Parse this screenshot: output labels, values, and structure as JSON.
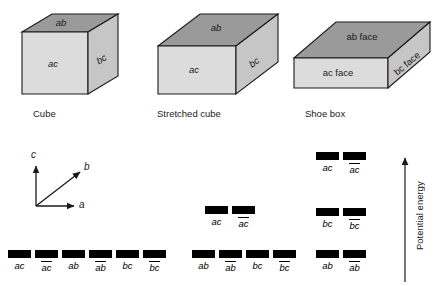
{
  "figure": {
    "energy_axis_label": "Potential energy",
    "colors": {
      "top_face": "#9a9a9a",
      "front_face": "#dcdcdc",
      "side_face": "#c6c6c6",
      "outline": "#1a1a1a",
      "level_bar": "#000000"
    }
  },
  "axis_triad": {
    "a": "a",
    "b": "b",
    "c": "c"
  },
  "boxes": [
    {
      "id": "cube",
      "caption": "Cube",
      "faces": {
        "top": "ab",
        "front": "ac",
        "side": "bc"
      }
    },
    {
      "id": "stretched-cube",
      "caption": "Stretched cube",
      "faces": {
        "top": "ab",
        "front": "ac",
        "side": "bc"
      }
    },
    {
      "id": "shoe-box",
      "caption": "Shoe box",
      "faces": {
        "top": "ab face",
        "front": "ac face",
        "side": "bc face"
      }
    }
  ],
  "level_diagrams": [
    {
      "id": "cube-levels",
      "for_box": "cube",
      "rows": [
        {
          "energy_rank": 1,
          "levels": [
            {
              "label": "ac",
              "overline": false
            },
            {
              "label": "ac",
              "overline": true
            },
            {
              "label": "ab",
              "overline": false
            },
            {
              "label": "ab",
              "overline": true
            },
            {
              "label": "bc",
              "overline": false
            },
            {
              "label": "bc",
              "overline": true
            }
          ]
        }
      ]
    },
    {
      "id": "stretched-cube-levels",
      "for_box": "stretched-cube",
      "rows": [
        {
          "energy_rank": 2,
          "levels": [
            {
              "label": "ac",
              "overline": false
            },
            {
              "label": "ac",
              "overline": true
            }
          ]
        },
        {
          "energy_rank": 1,
          "levels": [
            {
              "label": "ab",
              "overline": false
            },
            {
              "label": "ab",
              "overline": true
            },
            {
              "label": "bc",
              "overline": false
            },
            {
              "label": "bc",
              "overline": true
            }
          ]
        }
      ]
    },
    {
      "id": "shoe-box-levels",
      "for_box": "shoe-box",
      "rows": [
        {
          "energy_rank": 3,
          "levels": [
            {
              "label": "ac",
              "overline": false
            },
            {
              "label": "ac",
              "overline": true
            }
          ]
        },
        {
          "energy_rank": 2,
          "levels": [
            {
              "label": "bc",
              "overline": false
            },
            {
              "label": "bc",
              "overline": true
            }
          ]
        },
        {
          "energy_rank": 1,
          "levels": [
            {
              "label": "ab",
              "overline": false
            },
            {
              "label": "ab",
              "overline": true
            }
          ]
        }
      ]
    }
  ]
}
